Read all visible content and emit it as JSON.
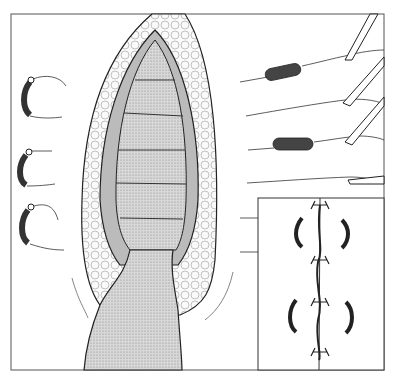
{
  "figure": {
    "type": "surgical-illustration",
    "colors": {
      "line": "#222222",
      "tissue_fill": "#cfcfcf",
      "fat_fill": "#f4f4f4",
      "suture_tube": "#444444",
      "background": "#ffffff"
    },
    "left_sutures_count": 3,
    "right_sutures_count": 5,
    "inset": {
      "description": "Closed wound with tied sutures",
      "knots_count": 4,
      "curved_bolsters_count": 4
    }
  }
}
